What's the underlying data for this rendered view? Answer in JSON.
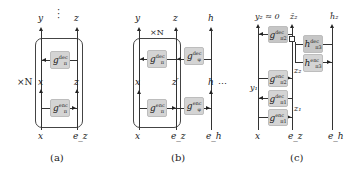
{
  "panels": {
    "a": {
      "caption": "(a)",
      "repeat": "×N",
      "top_labels": {
        "left": "y",
        "right": "z"
      },
      "mid_labels": {
        "left": "x",
        "right": "z"
      },
      "bottom_labels": {
        "left": "x",
        "right": "e_z"
      },
      "vdots": "⋮",
      "blocks": {
        "dec": {
          "base": "g",
          "sup": "dec",
          "sub": "π"
        },
        "enc": {
          "base": "g",
          "sup": "enc",
          "sub": "π"
        }
      }
    },
    "b": {
      "caption": "(b)",
      "repeat": "×N",
      "top_labels": {
        "left": "y",
        "mid": "z",
        "right": "h"
      },
      "mid_labels": {
        "left": "x",
        "mid": "z′",
        "right": "h"
      },
      "bottom_labels": {
        "left": "x",
        "mid": "e_z",
        "right": "e_h"
      },
      "hdots": "⋯",
      "blocks": {
        "dec_pi": {
          "base": "g",
          "sup": "dec",
          "sub": "π"
        },
        "enc_pi": {
          "base": "g",
          "sup": "enc",
          "sub": "π"
        },
        "dec_phi": {
          "base": "g",
          "sup": "dec",
          "sub": "φ"
        },
        "enc_phi": {
          "base": "g",
          "sup": "enc",
          "sub": "φ"
        }
      }
    },
    "c": {
      "caption": "(c)",
      "top_labels": {
        "left": "y₂ ≈ 0",
        "mid": "ẑ₂",
        "right": "ĥ₂"
      },
      "side_labels": {
        "y1": "y₁",
        "z2": "z₂",
        "z1": "z₁"
      },
      "bottom_labels": {
        "left": "x",
        "mid": "e_z",
        "right": "e_h"
      },
      "blocks": {
        "g_dec_2": {
          "base": "g",
          "sup": "dec",
          "sub": "π2"
        },
        "h_dec_3": {
          "base": "h",
          "sup": "dec",
          "sub": "π3"
        },
        "h_enc_3": {
          "base": "h",
          "sup": "enc",
          "sub": "π3"
        },
        "g_enc_2": {
          "base": "g",
          "sup": "enc",
          "sub": "π2"
        },
        "g_dec_1": {
          "base": "g",
          "sup": "dec",
          "sub": "π1"
        },
        "g_enc_1": {
          "base": "g",
          "sup": "enc",
          "sub": "π1"
        }
      }
    }
  }
}
